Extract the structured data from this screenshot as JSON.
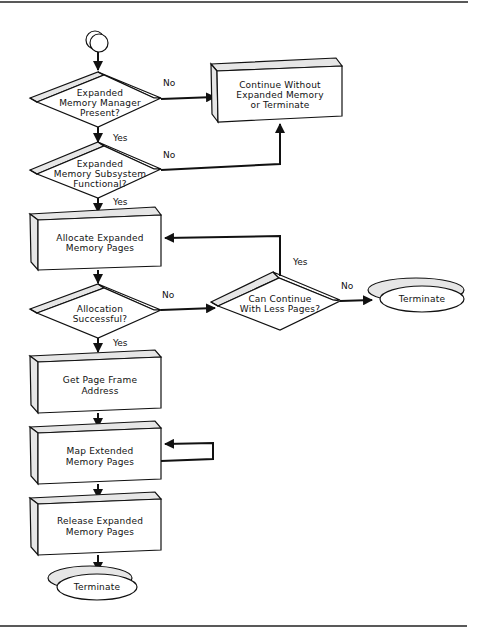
{
  "diagram": {
    "type": "flowchart",
    "start": {
      "shape": "connector-circle"
    },
    "nodes": {
      "d1": {
        "shape": "decision",
        "lines": [
          "Expanded",
          "Memory Manager",
          "Present?"
        ]
      },
      "d2": {
        "shape": "decision",
        "lines": [
          "Expanded",
          "Memory Subsystem",
          "Functional?"
        ]
      },
      "p_continue": {
        "shape": "process",
        "lines": [
          "Continue Without",
          "Expanded Memory",
          "or Terminate"
        ]
      },
      "p_allocate": {
        "shape": "process",
        "lines": [
          "Allocate  Expanded",
          "Memory Pages"
        ]
      },
      "d3": {
        "shape": "decision",
        "lines": [
          "Allocation",
          "Successful?"
        ]
      },
      "d4": {
        "shape": "decision",
        "lines": [
          "Can Continue",
          "With Less Pages?"
        ]
      },
      "t_right": {
        "shape": "terminator",
        "lines": [
          "Terminate"
        ]
      },
      "p_getframe": {
        "shape": "process",
        "lines": [
          "Get Page Frame",
          "Address"
        ]
      },
      "p_map": {
        "shape": "process",
        "lines": [
          "Map Extended",
          "Memory Pages"
        ]
      },
      "p_release": {
        "shape": "process",
        "lines": [
          "Release Expanded",
          "Memory Pages"
        ]
      },
      "t_bottom": {
        "shape": "terminator",
        "lines": [
          "Terminate"
        ]
      }
    },
    "edge_labels": {
      "d1_no": "No",
      "d1_yes": "Yes",
      "d2_no": "No",
      "d2_yes": "Yes",
      "d3_no": "No",
      "d3_yes": "Yes",
      "d4_yes": "Yes",
      "d4_no": "No"
    },
    "edges": [
      {
        "from": "start",
        "to": "d1"
      },
      {
        "from": "d1",
        "to": "p_continue",
        "label": "No"
      },
      {
        "from": "d1",
        "to": "d2",
        "label": "Yes"
      },
      {
        "from": "d2",
        "to": "p_continue",
        "label": "No"
      },
      {
        "from": "d2",
        "to": "p_allocate",
        "label": "Yes"
      },
      {
        "from": "p_allocate",
        "to": "d3"
      },
      {
        "from": "d3",
        "to": "d4",
        "label": "No"
      },
      {
        "from": "d3",
        "to": "p_getframe",
        "label": "Yes"
      },
      {
        "from": "d4",
        "to": "p_allocate",
        "label": "Yes"
      },
      {
        "from": "d4",
        "to": "t_right",
        "label": "No"
      },
      {
        "from": "p_getframe",
        "to": "p_map"
      },
      {
        "from": "p_map",
        "to": "p_map",
        "label": ""
      },
      {
        "from": "p_map",
        "to": "p_release"
      },
      {
        "from": "p_release",
        "to": "t_bottom"
      }
    ],
    "colors": {
      "line": "#111111",
      "bevel": "#e6e6e6",
      "face": "#ffffff"
    }
  }
}
